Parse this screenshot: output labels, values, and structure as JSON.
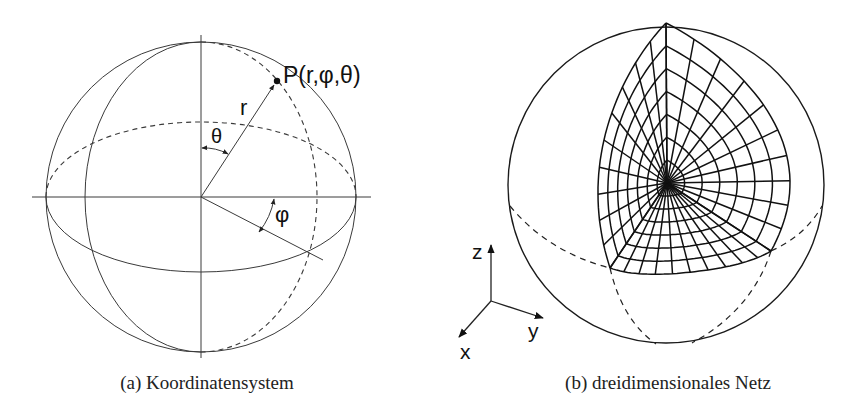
{
  "figure": {
    "panel_a": {
      "caption": "(a) Koordinatensystem",
      "point_label": "P(r,φ,θ)",
      "radius_label": "r",
      "theta_label": "θ",
      "phi_label": "φ"
    },
    "panel_b": {
      "caption": "(b) dreidimensionales Netz",
      "axis_labels": {
        "z": "z",
        "y": "y",
        "x": "x"
      },
      "mesh": {
        "rings": 7,
        "spokes_per_face": 10,
        "faces": 3
      }
    }
  }
}
